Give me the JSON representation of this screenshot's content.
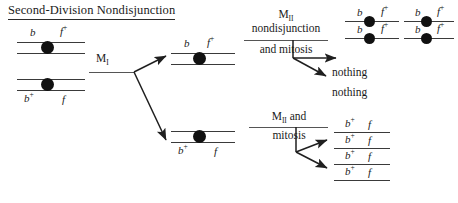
{
  "title": "Second-Division Nondisjunction",
  "alleles": {
    "b": "b",
    "b_plus_base": "b",
    "b_plus_sup": "+",
    "f": "f",
    "f_plus_base": "f",
    "f_plus_sup": "+"
  },
  "stages": {
    "m1_base": "M",
    "m1_sub": "I",
    "m2_base": "M",
    "m2_sub": "II",
    "nondisjunction": "nondisjunction",
    "and_mitosis": "and mitosis",
    "m2_and": "and",
    "mitosis": "mitosis"
  },
  "outcomes": {
    "nothing_1": "nothing",
    "nothing_2": "nothing"
  },
  "parent_cell": {
    "top_chromosome": {
      "left_allele": "b",
      "right_allele_base": "f",
      "right_allele_sup": "+"
    },
    "bottom_chromosome": {
      "left_allele_base": "b",
      "left_allele_sup": "+",
      "right_allele": "f"
    }
  },
  "meiosis1_products": {
    "upper": {
      "left_allele": "b",
      "right_allele_base": "f",
      "right_allele_sup": "+"
    },
    "lower": {
      "left_allele_base": "b",
      "left_allele_sup": "+",
      "right_allele": "f"
    }
  },
  "final_products": {
    "group_a": [
      {
        "left": "b",
        "right_base": "f",
        "right_sup": "+"
      },
      {
        "left": "b",
        "right_base": "f",
        "right_sup": "+"
      }
    ],
    "group_b": [
      {
        "left": "b",
        "right_base": "f",
        "right_sup": "+"
      },
      {
        "left": "b",
        "right_base": "f",
        "right_sup": "+"
      }
    ],
    "group_c": [
      {
        "left_base": "b",
        "left_sup": "+",
        "right": "f"
      },
      {
        "left_base": "b",
        "left_sup": "+",
        "right": "f"
      },
      {
        "left_base": "b",
        "left_sup": "+",
        "right": "f"
      },
      {
        "left_base": "b",
        "left_sup": "+",
        "right": "f"
      }
    ]
  },
  "colors": {
    "ink": "#1a1a1a",
    "strand": "#3a3a3a",
    "rule": "#555555",
    "centromere": "#111111",
    "background": "#ffffff"
  }
}
